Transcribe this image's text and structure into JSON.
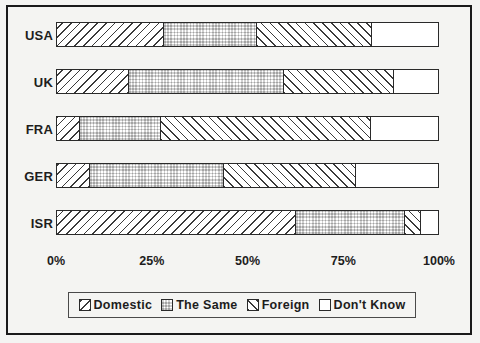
{
  "chart_data": {
    "type": "bar",
    "orientation": "horizontal",
    "stacked": true,
    "stacked_100": true,
    "title": "",
    "subtitle": "",
    "xlabel": "",
    "ylabel": "",
    "xlim": [
      0,
      100
    ],
    "xticks": [
      0,
      25,
      50,
      75,
      100
    ],
    "xtick_labels": [
      "0%",
      "25%",
      "50%",
      "75%",
      "100%"
    ],
    "grid": false,
    "legend_position": "bottom",
    "categories": [
      "USA",
      "UK",
      "FRA",
      "GER",
      "ISR"
    ],
    "series": [
      {
        "name": "Domestic",
        "pattern": "diagonal-hatch-down",
        "values": [
          27.7,
          18.5,
          5.7,
          8.4,
          62.4
        ]
      },
      {
        "name": "The Same",
        "pattern": "checkerboard",
        "values": [
          24.5,
          40.7,
          21.4,
          35.2,
          28.7
        ]
      },
      {
        "name": "Foreign",
        "pattern": "diagonal-hatch-up",
        "values": [
          30.3,
          29.0,
          55.1,
          34.7,
          4.2
        ]
      },
      {
        "name": "Don't Know",
        "pattern": "solid-white",
        "values": [
          17.5,
          11.7,
          17.8,
          21.7,
          4.7
        ]
      }
    ],
    "rows": [
      {
        "label": "USA",
        "segments": [
          27.7,
          24.5,
          30.3,
          17.5
        ]
      },
      {
        "label": "UK",
        "segments": [
          18.5,
          40.7,
          29.0,
          11.7
        ]
      },
      {
        "label": "FRA",
        "segments": [
          5.7,
          21.4,
          55.1,
          17.8
        ]
      },
      {
        "label": "GER",
        "segments": [
          8.4,
          35.2,
          34.7,
          21.7
        ]
      },
      {
        "label": "ISR",
        "segments": [
          62.4,
          28.7,
          4.2,
          4.7
        ]
      }
    ],
    "colors": {
      "ink": "#1d1d1d",
      "line": "#2a2a2a",
      "background": "#f4f4f2",
      "bar_fill": "#ffffff"
    }
  },
  "legend": {
    "items": [
      {
        "label": "Domestic",
        "pattern": "diagonal-hatch-down"
      },
      {
        "label": "The Same",
        "pattern": "checkerboard"
      },
      {
        "label": "Foreign",
        "pattern": "diagonal-hatch-up"
      },
      {
        "label": "Don't Know",
        "pattern": "solid-white"
      }
    ]
  }
}
